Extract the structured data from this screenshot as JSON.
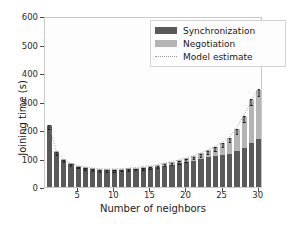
{
  "chart_data": {
    "type": "bar",
    "stacked": true,
    "title": "",
    "xlabel": "Number of neighbors",
    "ylabel": "Joining time (s)",
    "xlim": [
      0.4,
      30.6
    ],
    "ylim": [
      0,
      600
    ],
    "yticks": [
      0,
      100,
      200,
      300,
      400,
      500,
      600
    ],
    "xticks": [
      5,
      10,
      15,
      20,
      25,
      30
    ],
    "grid": false,
    "legend_position": "upper right",
    "categories": [
      1,
      2,
      3,
      4,
      5,
      6,
      7,
      8,
      9,
      10,
      11,
      12,
      13,
      14,
      15,
      16,
      17,
      18,
      19,
      20,
      21,
      22,
      23,
      24,
      25,
      26,
      27,
      28,
      29,
      30
    ],
    "series": [
      {
        "name": "Synchronization",
        "color": "#595959",
        "values": [
          215,
          122,
          95,
          80,
          72,
          67,
          63,
          61,
          60,
          60,
          61,
          62,
          63,
          65,
          68,
          71,
          75,
          79,
          83,
          88,
          93,
          98,
          104,
          110,
          113,
          117,
          126,
          136,
          155,
          170
        ]
      },
      {
        "name": "Negotiation",
        "color": "#b4b4b4",
        "values": [
          3,
          3,
          3,
          3,
          3,
          3,
          3,
          3,
          4,
          4,
          4,
          5,
          5,
          6,
          6,
          7,
          8,
          9,
          11,
          13,
          16,
          20,
          25,
          31,
          41,
          55,
          76,
          110,
          150,
          170
        ]
      }
    ],
    "errors": [
      8,
      5,
      4,
      4,
      3,
      3,
      3,
      3,
      3,
      3,
      3,
      3,
      3,
      3,
      4,
      4,
      4,
      4,
      5,
      5,
      5,
      6,
      6,
      7,
      8,
      8,
      9,
      10,
      11,
      12
    ],
    "model_estimate": {
      "name": "Model estimate",
      "style": "dotted",
      "color": "#9a9a9a",
      "x": [
        1,
        2,
        3,
        4,
        5,
        6,
        7,
        8,
        9,
        10,
        11,
        12,
        13,
        14,
        15,
        16,
        17,
        18,
        19,
        20,
        21,
        22,
        23,
        24,
        25,
        26,
        27,
        28,
        29,
        30
      ],
      "y": [
        218,
        126,
        99,
        84,
        76,
        71,
        67,
        65,
        64,
        64,
        65,
        67,
        69,
        72,
        75,
        79,
        84,
        89,
        95,
        102,
        110,
        119,
        130,
        142,
        156,
        173,
        203,
        246,
        292,
        340
      ]
    },
    "legend_entries": [
      {
        "label": "Synchronization",
        "marker": "patch",
        "color": "#595959"
      },
      {
        "label": "Negotiation",
        "marker": "patch",
        "color": "#b4b4b4"
      },
      {
        "label": "Model estimate",
        "marker": "dotted-line",
        "color": "#9a9a9a"
      }
    ]
  }
}
